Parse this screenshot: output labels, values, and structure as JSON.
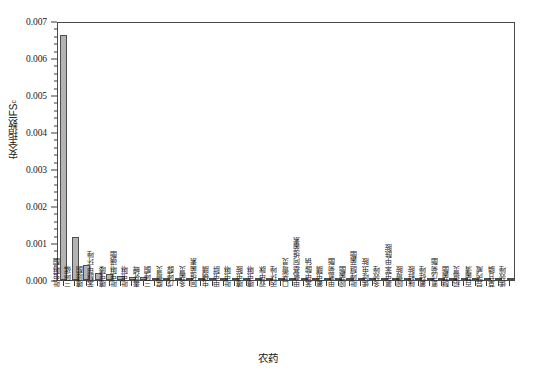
{
  "chart_data": {
    "type": "bar",
    "title": "",
    "xlabel": "农药",
    "ylabel": "安全指数IFS",
    "ylabel_main": "安全指数IFS",
    "ylabel_sub": "c",
    "ylim": [
      0,
      0.007
    ],
    "ytick_values": [
      0,
      0.001,
      0.002,
      0.003,
      0.004,
      0.005,
      0.006,
      0.007
    ],
    "ytick_labels": [
      "0.000",
      "0.001",
      "0.002",
      "0.003",
      "0.004",
      "0.005",
      "0.006",
      "0.007"
    ],
    "minor_ticks_per_interval": 4,
    "grid": false,
    "legend": null,
    "bar_color": "#b3b3b3",
    "bar_edge_color": "#4d4d4d",
    "categories": [
      "吡虫啉酮",
      "三唑磷",
      "噻嗪酮",
      "苯醚甲环唑",
      "噻虫嗪",
      "吡虫啉磺酯",
      "吡虫啉",
      "毒死蜱",
      "三唑酮",
      "腐霉灵",
      "戊唑醇",
      "多菌灵",
      "阿维菌素",
      "虫螨腈",
      "甲虫肼",
      "吡虫啉",
      "噻虫胺",
      "噻虫啉",
      "双甲脒",
      "丙环唑",
      "口恶霉灵",
      "甲氨基阿维菌素",
      "苯甲酸钠",
      "氟虫腈",
      "甲氰菊酯",
      "嘧菌酯",
      "吡唑醚菌酯",
      "烯啶虫胺",
      "多效唑",
      "氯虫苯甲酰胺",
      "嘧霉胺",
      "咪鲜胺",
      "氟硅唑",
      "氰戊菊酯",
      "醚菌酯",
      "稻瘟灵",
      "百菌清",
      "异丙威",
      "草甘膦",
      "烯效唑"
    ],
    "values": [
      0.00663,
      0.00115,
      0.0004,
      0.00018,
      0.00016,
      0.00011,
      8e-05,
      7e-05,
      5.5e-05,
      4.5e-05,
      4e-05,
      3.5e-05,
      3e-05,
      2.8e-05,
      2.5e-05,
      2.3e-05,
      2.1e-05,
      2e-05,
      1.9e-05,
      1.8e-05,
      1.7e-05,
      1.6e-05,
      1.5e-05,
      1.4e-05,
      1.3e-05,
      1.2e-05,
      1.1e-05,
      1e-05,
      9.5e-06,
      9e-06,
      8.5e-06,
      8e-06,
      7.5e-06,
      7e-06,
      6.5e-06,
      6e-06,
      5.5e-06,
      5e-06,
      4.5e-06,
      4e-06
    ]
  },
  "figure": {
    "background": "#ffffff",
    "frame_color": "#4a4a4a"
  }
}
